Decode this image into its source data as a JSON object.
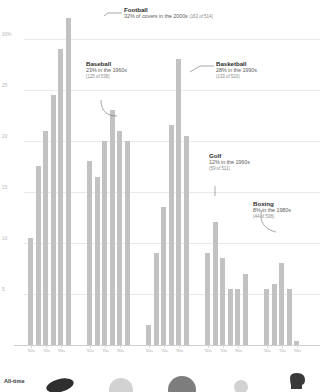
{
  "chart_data": {
    "type": "bar",
    "title": "",
    "subtitle": "",
    "xlabel": "",
    "ylabel": "",
    "ylim": [
      0,
      33
    ],
    "grid": true,
    "gridlines": [
      5,
      10,
      15,
      20,
      25,
      30
    ],
    "ytick_labels": [
      "30%",
      "25",
      "20",
      "15",
      "10",
      "5"
    ],
    "ytick_values": [
      30,
      25,
      20,
      15,
      10,
      5
    ],
    "legend_position": "none",
    "categories": [
      "'50s",
      "'60s",
      "'70s",
      "'80s",
      "'90s",
      "'00s"
    ],
    "xtick_labels_shown": [
      "'50s",
      "'70s",
      "'90s"
    ],
    "series": [
      {
        "name": "Football",
        "values": [
          10.5,
          17.5,
          21.0,
          24.5,
          29.0,
          32.0
        ]
      },
      {
        "name": "Baseball",
        "values": [
          18.0,
          16.5,
          20.0,
          23.0,
          21.0,
          20.0
        ]
      },
      {
        "name": "Basketball",
        "values": [
          2.0,
          9.0,
          13.5,
          21.5,
          28.0,
          20.5
        ]
      },
      {
        "name": "Golf",
        "values": [
          9.0,
          12.0,
          8.5,
          5.5,
          5.5,
          7.0
        ]
      },
      {
        "name": "Boxing",
        "values": [
          5.5,
          6.0,
          8.0,
          5.5,
          0.4,
          0.0
        ]
      }
    ],
    "annotations": [
      {
        "sport": "Football",
        "title": "Football",
        "line1": "32% of covers in the 2000s",
        "line2": "(163 of 514)",
        "value": 32,
        "decade": "2000s",
        "count": 163,
        "total": 514
      },
      {
        "sport": "Baseball",
        "title": "Baseball",
        "line1": "23% in the 1960s",
        "line2": "(125 of 538)",
        "value": 23,
        "decade": "1960s",
        "count": 125,
        "total": 538
      },
      {
        "sport": "Basketball",
        "title": "Basketball",
        "line1": "28% in the 1990s",
        "line2": "(133 of 520)",
        "value": 28,
        "decade": "1990s",
        "count": 133,
        "total": 520
      },
      {
        "sport": "Golf",
        "title": "Golf",
        "line1": "12% in the 1960s",
        "line2": "(59 of 511)",
        "value": 12,
        "decade": "1960s",
        "count": 59,
        "total": 511
      },
      {
        "sport": "Boxing",
        "title": "Boxing",
        "line1": "8% in the 1980s",
        "line2": "(44 of 538)",
        "value": 8,
        "decade": "1980s",
        "count": 44,
        "total": 538
      }
    ]
  },
  "footer": {
    "label": "All-time",
    "icons": [
      {
        "name": "football-icon",
        "sport": "Football"
      },
      {
        "name": "baseball-icon",
        "sport": "Baseball"
      },
      {
        "name": "basketball-icon",
        "sport": "Basketball"
      },
      {
        "name": "golf-icon",
        "sport": "Golf"
      },
      {
        "name": "boxing-glove-icon",
        "sport": "Boxing"
      }
    ]
  },
  "colors": {
    "bar": "#c2c2c2",
    "grid": "#e9e9e9",
    "axis": "#cfcfcf",
    "tick_text": "#b0b0b0",
    "anno_title": "#2e2e2e",
    "anno_body": "#5d5d5d",
    "anno_sub": "#8d8d8d",
    "background": "#ffffff"
  }
}
